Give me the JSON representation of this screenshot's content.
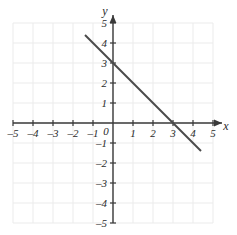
{
  "chart_data": {
    "type": "line",
    "title": "",
    "xlabel": "x",
    "ylabel": "y",
    "xlim": [
      -5,
      5
    ],
    "ylim": [
      -5,
      5
    ],
    "grid": true,
    "legend": "none",
    "x_ticks": [
      -5,
      -4,
      -3,
      -2,
      -1,
      1,
      2,
      3,
      4,
      5
    ],
    "y_ticks": [
      5,
      4,
      3,
      2,
      1,
      -1,
      -2,
      -3,
      -4,
      -5
    ],
    "x_tick_labels": [
      "–5",
      "–4",
      "–3",
      "–2",
      "–1",
      "1",
      "2",
      "3",
      "4",
      "5"
    ],
    "y_tick_labels": [
      "5",
      "4",
      "3",
      "2",
      "1",
      "–1",
      "–2",
      "–3",
      "–4",
      "–5"
    ],
    "origin_label": "0",
    "series": [
      {
        "name": "line",
        "equation": "y = -x + 3",
        "slope": -1,
        "intercept": 3,
        "x_intercept": 3,
        "y_intercept": 3,
        "points": [
          {
            "x": -1.4,
            "y": 4.4
          },
          {
            "x": 4.4,
            "y": -1.4
          }
        ]
      }
    ]
  },
  "colors": {
    "background": "#ffffff",
    "grid": "#ebebeb",
    "axis": "#3a3a3a",
    "line": "#4a4a4a",
    "text": "#2b2b2b"
  },
  "axis_labels": {
    "x": "x",
    "y": "y"
  }
}
